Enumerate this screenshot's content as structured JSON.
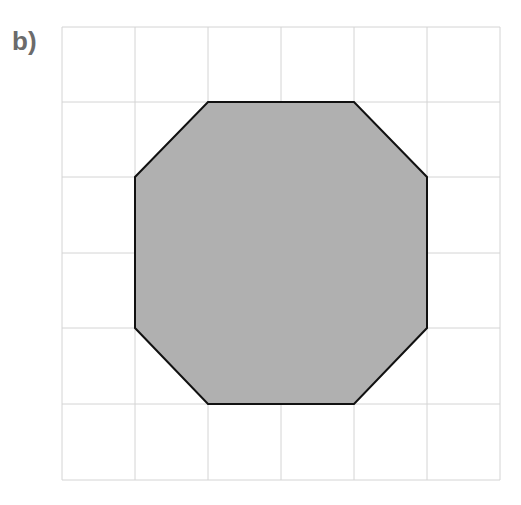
{
  "label": "b)",
  "grid": {
    "cols": 6,
    "rows": 6,
    "x_lines": [
      62,
      135,
      208,
      281,
      354,
      427,
      500
    ],
    "y_lines": [
      27,
      102,
      177,
      253,
      328,
      404,
      480
    ],
    "line_color": "#d4d4d4"
  },
  "shape": {
    "type": "octagon",
    "fill": "#b0b0b0",
    "stroke": "#111111",
    "points": "208,102 354,102 427,177 427,328 354,404 208,404 135,328 135,177"
  }
}
